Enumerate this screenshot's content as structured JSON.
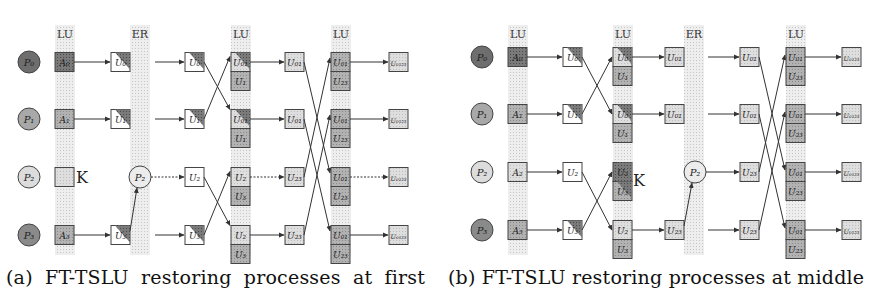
{
  "panels": [
    {
      "id": "a",
      "caption": "(a) FT-TSLU restoring processes at first",
      "processes": [
        "P0",
        "P1",
        "P2",
        "P3"
      ],
      "process_labels": [
        "P₀",
        "P₁",
        "P₂",
        "P₃"
      ],
      "process_fill": [
        "#6e6e6e",
        "#a8a8a8",
        "#dcdcdc",
        "#8a8a8a"
      ],
      "bands": [
        {
          "label": "LU",
          "kind": "LU",
          "x": 55
        },
        {
          "label": "ER",
          "kind": "ER",
          "x": 130
        },
        {
          "label": "LU",
          "kind": "LU",
          "x": 231
        },
        {
          "label": "LU",
          "kind": "LU",
          "x": 331
        }
      ],
      "rows_y": [
        62,
        119,
        177,
        235
      ],
      "initial_blocks": [
        "A₀",
        "A₁",
        "A₂",
        "A₃"
      ],
      "failed_process": "P2",
      "failed_marker": "K",
      "stage1": [
        "U₀",
        "U₁",
        "",
        "U₃"
      ],
      "restored_node": "P₂",
      "stage2": [
        "U₀",
        "U₁",
        "U₂",
        "U₃"
      ],
      "stage3_top": [
        "U₀₁",
        "U₀₁",
        "U₂",
        "U₂"
      ],
      "stage3_bot": [
        "U₁",
        "U₁",
        "U₃",
        "U₃"
      ],
      "stage4": [
        "U₀₁",
        "U₀₁",
        "U₂₃",
        "U₂₃"
      ],
      "stage5_top": [
        "U₀₁",
        "U₀₁",
        "U₀₁",
        "U₀₁"
      ],
      "stage5_bot": [
        "U₂₃",
        "U₂₃",
        "U₂₃",
        "U₂₃"
      ],
      "outputs": [
        "U₀₁₂₃",
        "U₀₁₂₃",
        "U₀₁₂₃",
        "U₀₁₂₃"
      ]
    },
    {
      "id": "b",
      "caption": "(b) FT-TSLU restoring processes at middle",
      "processes": [
        "P0",
        "P1",
        "P2",
        "P3"
      ],
      "process_labels": [
        "P₀",
        "P₁",
        "P₂",
        "P₃"
      ],
      "process_fill": [
        "#6e6e6e",
        "#a8a8a8",
        "#dcdcdc",
        "#8a8a8a"
      ],
      "bands": [
        {
          "label": "LU",
          "kind": "LU",
          "x": 508
        },
        {
          "label": "LU",
          "kind": "LU",
          "x": 613
        },
        {
          "label": "ER",
          "kind": "ER",
          "x": 684
        },
        {
          "label": "LU",
          "kind": "LU",
          "x": 786
        }
      ],
      "rows_y": [
        57,
        114,
        172,
        230
      ],
      "initial_blocks": [
        "A₀",
        "A₁",
        "A₂",
        "A₃"
      ],
      "failed_process": "P2",
      "failed_marker": "K",
      "stage1": [
        "U₀",
        "U₁",
        "U₂",
        "U₃"
      ],
      "stage2_top": [
        "U₀",
        "U₀",
        "U₂",
        "U₂"
      ],
      "stage2_bot": [
        "U₁",
        "U₁",
        "U₃",
        "U₃"
      ],
      "stage3": [
        "U₀₁",
        "U₀₁",
        "",
        "U₂₃"
      ],
      "restored_node": "P₂",
      "stage4": [
        "U₀₁",
        "U₀₁",
        "U₂₃",
        "U₂₃"
      ],
      "stage5_top": [
        "U₀₁",
        "U₀₁",
        "U₀₁",
        "U₀₁"
      ],
      "stage5_bot": [
        "U₂₃",
        "U₂₃",
        "U₂₃",
        "U₂₃"
      ],
      "outputs": [
        "U₀₁₂₃",
        "U₀₁₂₃",
        "U₀₁₂₃",
        "U₀₁₂₃"
      ]
    }
  ],
  "colors": {
    "band": "#ebebeb",
    "band_dot": "#c8c8c8",
    "block_dark": "#6a6a6a",
    "block_mid": "#9a9a9a",
    "block_light": "#d4d4d4",
    "stroke": "#333333"
  }
}
